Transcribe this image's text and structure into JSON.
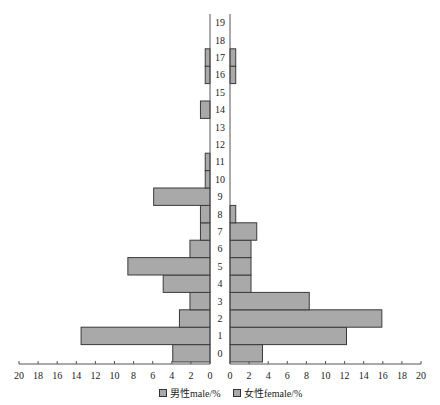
{
  "chart_data": {
    "type": "bar",
    "orientation": "horizontal-population-pyramid",
    "title": "",
    "categories": [
      "0",
      "1",
      "2",
      "3",
      "4",
      "5",
      "6",
      "7",
      "8",
      "9",
      "10",
      "11",
      "12",
      "13",
      "14",
      "15",
      "16",
      "17",
      "18",
      "19"
    ],
    "series": [
      {
        "name": "男性male/%",
        "side": "left",
        "values": [
          3.9,
          13.5,
          3.2,
          2.1,
          4.9,
          8.6,
          2.1,
          1.0,
          1.0,
          5.9,
          0.5,
          0.5,
          0,
          0,
          1.0,
          0,
          0.5,
          0.5,
          0,
          0
        ]
      },
      {
        "name": "女性female/%",
        "side": "right",
        "values": [
          3.4,
          12.2,
          15.9,
          8.3,
          2.2,
          2.2,
          2.2,
          2.8,
          0.6,
          0,
          0,
          0,
          0,
          0,
          0,
          0,
          0.6,
          0.6,
          0,
          0
        ]
      }
    ],
    "x_ticks_left": [
      "20",
      "18",
      "16",
      "14",
      "12",
      "10",
      "8",
      "6",
      "4",
      "2",
      "0"
    ],
    "x_ticks_right": [
      "0",
      "2",
      "4",
      "6",
      "8",
      "10",
      "12",
      "14",
      "16",
      "18",
      "20"
    ],
    "xlim": [
      0,
      20
    ],
    "xlabel": "",
    "ylabel": "",
    "legend": [
      "男性male/%",
      "女性female/%"
    ],
    "legend_position": "bottom",
    "grid": false,
    "bar_color": "#a9a9a9"
  },
  "legend": {
    "male": "男性male/%",
    "female": "女性female/%"
  }
}
